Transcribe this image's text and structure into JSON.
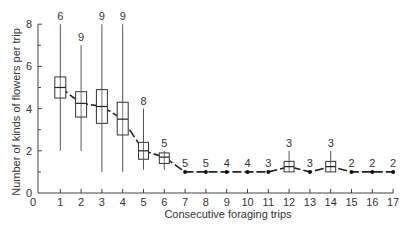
{
  "chart_data": {
    "type": "box",
    "title": "",
    "xlabel": "Consecutive foraging trips",
    "ylabel": "Number of kinds of flowers per trip",
    "xlim": [
      0,
      17
    ],
    "ylim": [
      0,
      8
    ],
    "x_ticks": [
      0,
      1,
      2,
      3,
      4,
      5,
      6,
      7,
      8,
      9,
      10,
      11,
      12,
      13,
      14,
      15,
      16,
      17
    ],
    "y_ticks": [
      0,
      2,
      4,
      6,
      8
    ],
    "y_minor_ticks": [
      1,
      3,
      5,
      7
    ],
    "grid": false,
    "legend": null,
    "series": [
      {
        "trip": 1,
        "n": 6,
        "whisker_low": 2.0,
        "q1": 4.5,
        "median": 5.0,
        "q3": 5.5,
        "whisker_high": 8.0
      },
      {
        "trip": 2,
        "n": 9,
        "whisker_low": 2.0,
        "q1": 3.6,
        "median": 4.25,
        "q3": 4.8,
        "whisker_high": 7.0
      },
      {
        "trip": 3,
        "n": 9,
        "whisker_low": 1.0,
        "q1": 3.3,
        "median": 4.1,
        "q3": 4.9,
        "whisker_high": 8.0
      },
      {
        "trip": 4,
        "n": 9,
        "whisker_low": 1.0,
        "q1": 2.75,
        "median": 3.5,
        "q3": 4.3,
        "whisker_high": 8.0
      },
      {
        "trip": 5,
        "n": 8,
        "whisker_low": 1.1,
        "q1": 1.6,
        "median": 2.0,
        "q3": 2.4,
        "whisker_high": 4.0
      },
      {
        "trip": 6,
        "n": 5,
        "whisker_low": 1.1,
        "q1": 1.4,
        "median": 1.7,
        "q3": 1.9,
        "whisker_high": 2.0
      },
      {
        "trip": 7,
        "n": 5,
        "median": 1.0
      },
      {
        "trip": 8,
        "n": 5,
        "median": 1.0
      },
      {
        "trip": 9,
        "n": 4,
        "median": 1.0
      },
      {
        "trip": 10,
        "n": 4,
        "median": 1.0
      },
      {
        "trip": 11,
        "n": 3,
        "median": 1.0
      },
      {
        "trip": 12,
        "n": 3,
        "whisker_low": 1.0,
        "q1": 1.0,
        "median": 1.25,
        "q3": 1.5,
        "whisker_high": 2.0
      },
      {
        "trip": 13,
        "n": 3,
        "median": 1.0
      },
      {
        "trip": 14,
        "n": 3,
        "whisker_low": 1.0,
        "q1": 1.0,
        "median": 1.25,
        "q3": 1.5,
        "whisker_high": 2.0
      },
      {
        "trip": 15,
        "n": 2,
        "median": 1.0
      },
      {
        "trip": 16,
        "n": 2,
        "median": 1.0
      },
      {
        "trip": 17,
        "n": 2,
        "median": 1.0
      }
    ],
    "annotations": "Number above each trip indicates sample size (n)."
  }
}
